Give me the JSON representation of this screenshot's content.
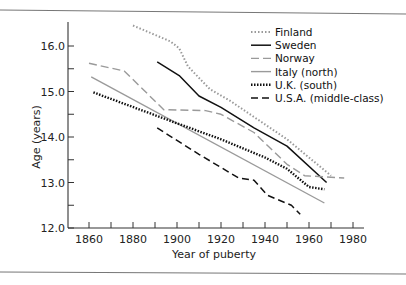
{
  "chart_data": {
    "type": "line",
    "title": "",
    "xlabel": "Year of puberty",
    "ylabel": "Age (years)",
    "xlim": [
      1850,
      1985
    ],
    "ylim": [
      12.0,
      16.5
    ],
    "x_ticks": [
      1860,
      1870,
      1880,
      1890,
      1900,
      1910,
      1920,
      1930,
      1940,
      1950,
      1960,
      1970,
      1980
    ],
    "x_tick_labels": [
      "1860",
      "1880",
      "1900",
      "1920",
      "1940",
      "1960",
      "1980"
    ],
    "x_tick_label_values": [
      1860,
      1880,
      1900,
      1920,
      1940,
      1960,
      1980
    ],
    "y_ticks": [
      12.0,
      12.5,
      13.0,
      13.5,
      14.0,
      14.5,
      15.0,
      15.5,
      16.0
    ],
    "y_tick_labels": [
      "12.0",
      "13.0",
      "14.0",
      "15.0",
      "16.0"
    ],
    "y_tick_label_values": [
      12.0,
      13.0,
      14.0,
      15.0,
      16.0
    ],
    "grid": false,
    "legend_position": "top-right",
    "series": [
      {
        "name": "Finland",
        "style": "dotted",
        "color": "#9a9a9a",
        "x": [
          1880,
          1897,
          1901,
          1905,
          1915,
          1924,
          1950,
          1970
        ],
        "y": [
          16.45,
          16.1,
          15.95,
          15.55,
          15.05,
          14.8,
          13.95,
          13.15
        ]
      },
      {
        "name": "Sweden",
        "style": "solid",
        "color": "#111111",
        "x": [
          1891,
          1901,
          1910,
          1920,
          1935,
          1950,
          1968
        ],
        "y": [
          15.65,
          15.35,
          14.9,
          14.65,
          14.2,
          13.8,
          13.0
        ]
      },
      {
        "name": "Norway",
        "style": "dashed",
        "color": "#9a9a9a",
        "x": [
          1860,
          1876,
          1894,
          1913,
          1920,
          1935,
          1950,
          1958,
          1976
        ],
        "y": [
          15.62,
          15.45,
          14.6,
          14.58,
          14.5,
          14.1,
          13.4,
          13.15,
          13.1
        ]
      },
      {
        "name": "Italy (north)",
        "style": "solid",
        "color": "#9a9a9a",
        "x": [
          1861,
          1967
        ],
        "y": [
          15.32,
          12.55
        ]
      },
      {
        "name": "U.K. (south)",
        "style": "dotted",
        "color": "#111111",
        "x": [
          1862,
          1900,
          1920,
          1940,
          1950,
          1960,
          1967
        ],
        "y": [
          14.98,
          14.3,
          13.95,
          13.55,
          13.3,
          12.9,
          12.85
        ]
      },
      {
        "name": "U.S.A. (middle-class)",
        "style": "dashed",
        "color": "#111111",
        "x": [
          1891,
          1910,
          1928,
          1935,
          1941,
          1952,
          1956
        ],
        "y": [
          14.2,
          13.62,
          13.1,
          13.05,
          12.72,
          12.5,
          12.3
        ]
      }
    ]
  }
}
